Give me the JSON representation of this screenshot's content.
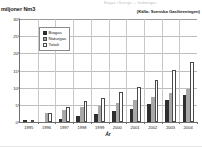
{
  "top_strip_text": "Biogas i Sverige — fordonsgas",
  "source_note": "(Källa: Svenska Gasföreningen)",
  "y_axis_unit": "miljoner Nm3",
  "x_axis_title": "År",
  "legend": {
    "items": [
      {
        "label": "Biogas",
        "color": "#2f2f2f",
        "style": "filled-dark"
      },
      {
        "label": "Naturgas",
        "color": "#a8a8a8",
        "style": "filled-gray"
      },
      {
        "label": "Totalt",
        "color": "#ffffff",
        "style": "outline-white"
      }
    ]
  },
  "colors": {
    "biogas": "#2f2f2f",
    "naturgas": "#a8a8a8",
    "totalt": "#ffffff",
    "outline": "#4a4a4a",
    "grid": "#bdbdbd",
    "axis": "#6e6e6e"
  },
  "chart_data": {
    "type": "bar",
    "title": "",
    "subtitle": "",
    "xlabel": "År",
    "ylabel": "miljoner Nm3",
    "ylim": [
      0,
      30
    ],
    "yticks": [
      0,
      5,
      10,
      15,
      20,
      25,
      30
    ],
    "grid": true,
    "legend_position": "inside-top-left",
    "categories": [
      "1995",
      "1996",
      "1997",
      "1998",
      "1999",
      "2000",
      "2001",
      "2002",
      "2003",
      "2004"
    ],
    "series": [
      {
        "name": "Biogas",
        "values": [
          0.6,
          0.0,
          0.8,
          1.7,
          2.3,
          3.1,
          3.8,
          5.3,
          6.4,
          7.8
        ]
      },
      {
        "name": "Naturgas",
        "values": [
          0.0,
          2.7,
          3.6,
          4.3,
          4.7,
          5.5,
          6.4,
          7.3,
          8.5,
          9.7
        ]
      },
      {
        "name": "Totalt",
        "values": [
          0.7,
          2.7,
          4.4,
          6.0,
          7.0,
          8.6,
          10.2,
          12.3,
          15.2,
          17.6
        ]
      }
    ]
  }
}
